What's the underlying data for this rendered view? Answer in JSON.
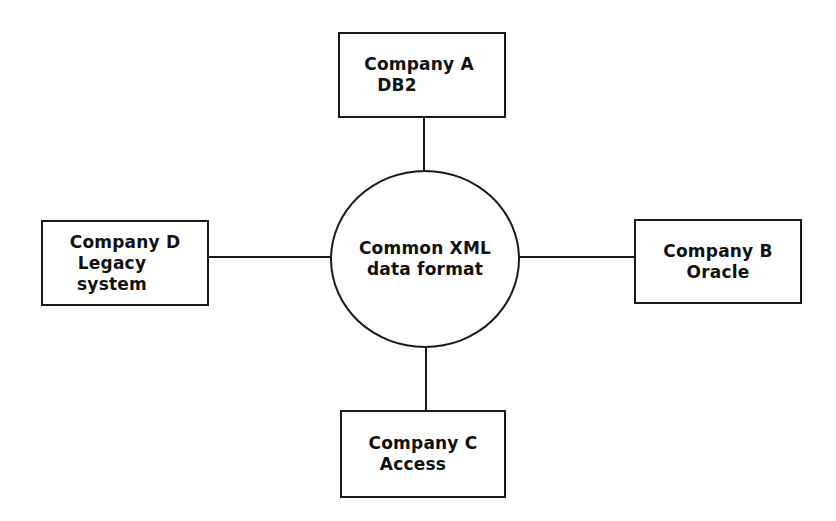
{
  "diagram": {
    "type": "hub-and-spoke",
    "line_color": "#1a1a1a",
    "background": "#ffffff",
    "hub": {
      "shape": "circle",
      "label_line1": "Common XML",
      "label_line2": "data format"
    },
    "nodes": {
      "company_a": {
        "position": "top",
        "label_line1": "Company A",
        "label_line2": "DB2"
      },
      "company_b": {
        "position": "right",
        "label_line1": "Company B",
        "label_line2": "Oracle"
      },
      "company_c": {
        "position": "bottom",
        "label_line1": "Company C",
        "label_line2": "Access"
      },
      "company_d": {
        "position": "left",
        "label_line1": "Company D",
        "label_line2": "Legacy",
        "label_line3": "system"
      }
    },
    "edges": [
      {
        "from": "company_a",
        "to": "hub"
      },
      {
        "from": "company_b",
        "to": "hub"
      },
      {
        "from": "company_c",
        "to": "hub"
      },
      {
        "from": "company_d",
        "to": "hub"
      }
    ]
  }
}
